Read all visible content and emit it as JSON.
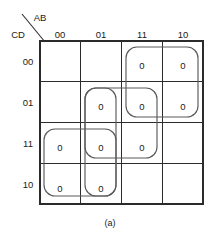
{
  "figure": {
    "caption": "(a)",
    "type": "karnaugh-map",
    "variables_top": "AB",
    "variables_left": "CD"
  },
  "axes": {
    "top_label": "AB",
    "left_label": "CD",
    "column_headers": [
      "00",
      "01",
      "11",
      "10"
    ],
    "row_headers": [
      "00",
      "01",
      "11",
      "10"
    ]
  },
  "cells": [
    {
      "row": "00",
      "col": "00",
      "value": ""
    },
    {
      "row": "00",
      "col": "01",
      "value": ""
    },
    {
      "row": "00",
      "col": "11",
      "value": "0"
    },
    {
      "row": "00",
      "col": "10",
      "value": "0"
    },
    {
      "row": "01",
      "col": "00",
      "value": ""
    },
    {
      "row": "01",
      "col": "01",
      "value": "0"
    },
    {
      "row": "01",
      "col": "11",
      "value": "0"
    },
    {
      "row": "01",
      "col": "10",
      "value": "0"
    },
    {
      "row": "11",
      "col": "00",
      "value": "0"
    },
    {
      "row": "11",
      "col": "01",
      "value": "0"
    },
    {
      "row": "11",
      "col": "11",
      "value": "0"
    },
    {
      "row": "11",
      "col": "10",
      "value": ""
    },
    {
      "row": "10",
      "col": "00",
      "value": "0"
    },
    {
      "row": "10",
      "col": "01",
      "value": "0"
    },
    {
      "row": "10",
      "col": "11",
      "value": ""
    },
    {
      "row": "10",
      "col": "10",
      "value": ""
    }
  ],
  "cell_text": {
    "r0c0": "",
    "r0c1": "",
    "r0c2": "0",
    "r0c3": "0",
    "r1c0": "",
    "r1c1": "0",
    "r1c2": "0",
    "r1c3": "0",
    "r2c0": "0",
    "r2c1": "0",
    "r2c2": "0",
    "r2c3": "",
    "r3c0": "0",
    "r3c1": "0",
    "r3c2": "",
    "r3c3": ""
  },
  "groups": [
    {
      "name": "group-top-right",
      "cells": [
        "00/11",
        "00/10",
        "01/11",
        "01/10"
      ],
      "size": 4
    },
    {
      "name": "group-middle-vertical",
      "cells": [
        "01/01",
        "01/11",
        "11/01",
        "11/11"
      ],
      "size": 4
    },
    {
      "name": "group-row11-horizontal",
      "cells": [
        "11/01",
        "11/11"
      ],
      "size": 2
    },
    {
      "name": "group-bottom-left",
      "cells": [
        "11/00",
        "11/01",
        "10/00",
        "10/01"
      ],
      "size": 4
    }
  ],
  "colors": {
    "grid_line": "#2b2b2b",
    "loop_line": "#5a5a5a",
    "text": "#1a1a1a",
    "background": "#ffffff"
  }
}
